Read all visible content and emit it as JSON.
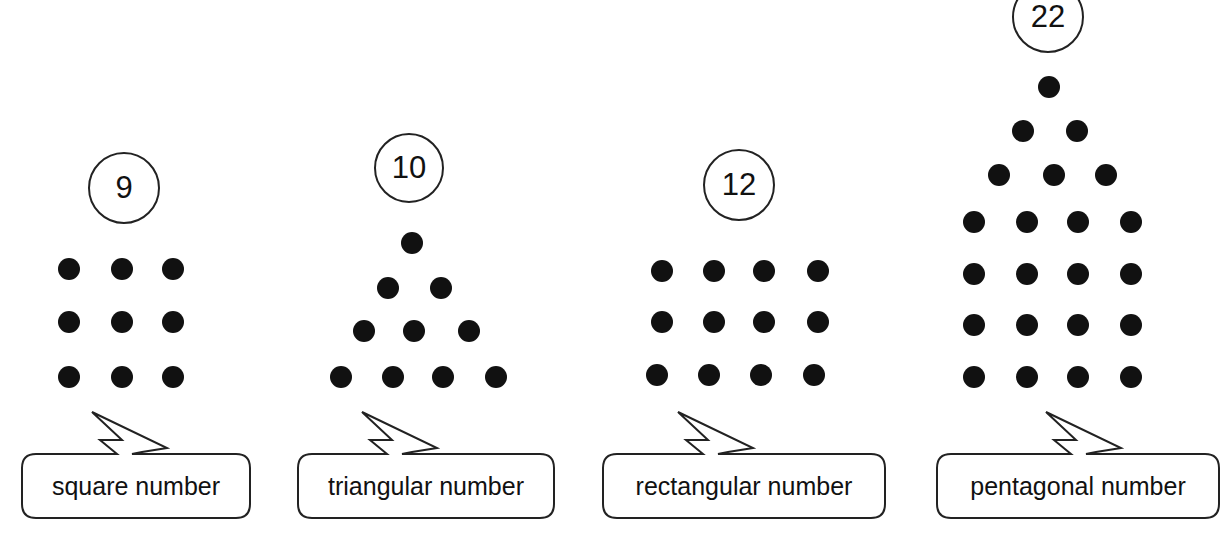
{
  "figures": [
    {
      "name": "square",
      "count": "9",
      "label": "square number",
      "circle": {
        "cx": 124,
        "cy": 188,
        "r": 36
      },
      "dots": [
        [
          69,
          269
        ],
        [
          122,
          269
        ],
        [
          173,
          269
        ],
        [
          69,
          322
        ],
        [
          122,
          322
        ],
        [
          173,
          322
        ],
        [
          69,
          377
        ],
        [
          122,
          377
        ],
        [
          173,
          377
        ]
      ],
      "box": {
        "x": 22,
        "y": 454,
        "w": 228,
        "h": 64
      },
      "bolt": {
        "x": 92,
        "y": 412
      }
    },
    {
      "name": "triangular",
      "count": "10",
      "label": "triangular number",
      "circle": {
        "cx": 409,
        "cy": 168,
        "r": 35
      },
      "dots": [
        [
          412,
          243
        ],
        [
          388,
          288
        ],
        [
          441,
          288
        ],
        [
          364,
          331
        ],
        [
          414,
          331
        ],
        [
          469,
          331
        ],
        [
          341,
          377
        ],
        [
          393,
          377
        ],
        [
          443,
          377
        ],
        [
          496,
          377
        ]
      ],
      "box": {
        "x": 298,
        "y": 454,
        "w": 256,
        "h": 64
      },
      "bolt": {
        "x": 362,
        "y": 412
      }
    },
    {
      "name": "rectangular",
      "count": "12",
      "label": "rectangular number",
      "circle": {
        "cx": 739,
        "cy": 185,
        "r": 36
      },
      "dots": [
        [
          662,
          271
        ],
        [
          714,
          271
        ],
        [
          764,
          271
        ],
        [
          818,
          271
        ],
        [
          662,
          322
        ],
        [
          714,
          322
        ],
        [
          764,
          322
        ],
        [
          818,
          322
        ],
        [
          657,
          375
        ],
        [
          709,
          375
        ],
        [
          761,
          375
        ],
        [
          814,
          375
        ]
      ],
      "box": {
        "x": 603,
        "y": 454,
        "w": 282,
        "h": 64
      },
      "bolt": {
        "x": 678,
        "y": 412
      }
    },
    {
      "name": "pentagonal",
      "count": "22",
      "label": "pentagonal number",
      "circle": {
        "cx": 1048,
        "cy": 17,
        "r": 36
      },
      "dots": [
        [
          1049,
          87
        ],
        [
          1023,
          131
        ],
        [
          1077,
          131
        ],
        [
          999,
          175
        ],
        [
          1054,
          175
        ],
        [
          1106,
          175
        ],
        [
          974,
          222
        ],
        [
          1027,
          222
        ],
        [
          1078,
          222
        ],
        [
          1131,
          222
        ],
        [
          974,
          274
        ],
        [
          1027,
          274
        ],
        [
          1078,
          274
        ],
        [
          1131,
          274
        ],
        [
          974,
          325
        ],
        [
          1027,
          325
        ],
        [
          1078,
          325
        ],
        [
          1131,
          325
        ],
        [
          974,
          377
        ],
        [
          1027,
          377
        ],
        [
          1078,
          377
        ],
        [
          1131,
          377
        ]
      ],
      "box": {
        "x": 937,
        "y": 454,
        "w": 282,
        "h": 64
      },
      "bolt": {
        "x": 1046,
        "y": 412
      }
    }
  ]
}
